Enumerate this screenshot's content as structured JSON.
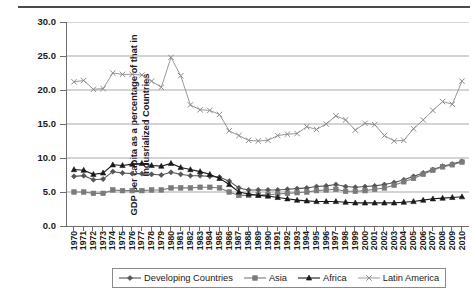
{
  "chart_data": {
    "type": "line",
    "title": "",
    "xlabel": "",
    "ylabel": "GDP per capita as a percentage of that in Indusrialized Countries",
    "ylim": [
      0.0,
      30.0
    ],
    "yticks": [
      "0.0",
      "5.0",
      "10.0",
      "15.0",
      "20.0",
      "25.0",
      "30.0"
    ],
    "ytick_values": [
      0.0,
      5.0,
      10.0,
      15.0,
      20.0,
      25.0,
      30.0
    ],
    "grid": "horizontal",
    "legend_position": "bottom",
    "x": [
      1970,
      1971,
      1972,
      1973,
      1974,
      1975,
      1976,
      1977,
      1978,
      1979,
      1980,
      1981,
      1982,
      1983,
      1984,
      1985,
      1986,
      1987,
      1988,
      1989,
      1990,
      1991,
      1992,
      1993,
      1994,
      1995,
      1996,
      1997,
      1998,
      1999,
      2000,
      2001,
      2002,
      2003,
      2004,
      2005,
      2006,
      2007,
      2008,
      2009,
      2010
    ],
    "categories": [
      "1970",
      "1971",
      "1972",
      "1973",
      "1974",
      "1975",
      "1976",
      "1977",
      "1978",
      "1979",
      "1980",
      "1981",
      "1982",
      "1983",
      "1984",
      "1985",
      "1986",
      "1987",
      "1988",
      "1989",
      "1990",
      "1991",
      "1992",
      "1993",
      "1994",
      "1995",
      "1996",
      "1997",
      "1998",
      "1999",
      "2000",
      "2001",
      "2002",
      "2003",
      "2004",
      "2005",
      "2006",
      "2007",
      "2008",
      "2009",
      "2010"
    ],
    "series": [
      {
        "name": "Developing Countries",
        "marker": "diamond",
        "color": "#555555",
        "values": [
          7.3,
          7.4,
          6.8,
          6.9,
          8.0,
          7.8,
          7.7,
          7.7,
          7.6,
          7.5,
          7.9,
          7.6,
          7.4,
          7.4,
          7.3,
          7.2,
          6.6,
          5.6,
          5.3,
          5.3,
          5.3,
          5.3,
          5.4,
          5.5,
          5.6,
          5.8,
          5.9,
          6.1,
          5.8,
          5.7,
          5.8,
          5.9,
          6.1,
          6.4,
          6.8,
          7.3,
          7.8,
          8.3,
          8.8,
          9.1,
          9.5
        ]
      },
      {
        "name": "Asia",
        "marker": "square",
        "color": "#7a7a7a",
        "values": [
          5.0,
          5.0,
          4.8,
          4.8,
          5.3,
          5.2,
          5.2,
          5.2,
          5.3,
          5.3,
          5.6,
          5.6,
          5.6,
          5.7,
          5.7,
          5.6,
          5.0,
          4.5,
          4.5,
          4.6,
          4.6,
          4.7,
          4.8,
          4.9,
          5.0,
          5.2,
          5.3,
          5.4,
          5.1,
          5.1,
          5.2,
          5.4,
          5.6,
          6.0,
          6.5,
          7.0,
          7.6,
          8.2,
          8.7,
          9.0,
          9.4
        ]
      },
      {
        "name": "Africa",
        "marker": "triangle",
        "color": "#1a1a1a",
        "values": [
          8.3,
          8.2,
          7.6,
          7.8,
          9.0,
          8.9,
          9.1,
          9.2,
          8.9,
          8.8,
          9.2,
          8.6,
          8.3,
          8.0,
          7.6,
          7.0,
          6.1,
          5.0,
          4.7,
          4.5,
          4.4,
          4.2,
          4.0,
          3.8,
          3.7,
          3.6,
          3.6,
          3.6,
          3.5,
          3.4,
          3.4,
          3.4,
          3.4,
          3.4,
          3.5,
          3.6,
          3.8,
          4.0,
          4.1,
          4.2,
          4.3
        ]
      },
      {
        "name": "Latin America",
        "marker": "cross",
        "color": "#8c8c8c",
        "values": [
          21.2,
          21.4,
          20.1,
          20.2,
          22.5,
          22.3,
          22.3,
          22.2,
          21.3,
          20.4,
          24.8,
          22.1,
          17.8,
          17.1,
          17.0,
          16.4,
          14.0,
          13.3,
          12.6,
          12.5,
          12.6,
          13.3,
          13.5,
          13.6,
          14.6,
          14.2,
          15.0,
          16.2,
          15.6,
          14.1,
          15.1,
          14.9,
          13.3,
          12.5,
          12.6,
          14.3,
          15.6,
          17.0,
          18.3,
          17.9,
          21.3
        ]
      }
    ]
  },
  "legend": {
    "items": [
      {
        "label": "Developing Countries",
        "marker": "diamond"
      },
      {
        "label": "Asia",
        "marker": "square"
      },
      {
        "label": "Africa",
        "marker": "triangle"
      },
      {
        "label": "Latin America",
        "marker": "cross"
      }
    ]
  }
}
